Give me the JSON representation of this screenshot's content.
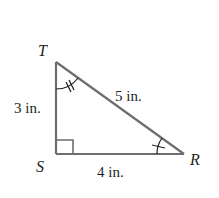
{
  "diagram": {
    "type": "right-triangle",
    "colors": {
      "stroke": "#6d6e71",
      "text": "#231f20",
      "background": "#ffffff"
    },
    "vertices": {
      "T": {
        "label": "T",
        "x": 56,
        "y": 62
      },
      "S": {
        "label": "S",
        "x": 56,
        "y": 154
      },
      "R": {
        "label": "R",
        "x": 184,
        "y": 154
      }
    },
    "sides": {
      "TS": {
        "label": "3 in."
      },
      "TR": {
        "label": "5 in."
      },
      "SR": {
        "label": "4 in."
      }
    },
    "angle_marks": {
      "S": "right-angle",
      "T": "double-arc-tick",
      "R": "single-arc-tick"
    }
  }
}
